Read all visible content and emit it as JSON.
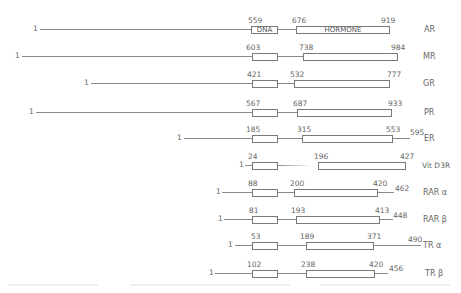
{
  "domain_labels": {
    "dna": "DNA",
    "hormone": "HORMONE"
  },
  "receptors": [
    {
      "name": "AR",
      "start": "1",
      "dna_start": "559",
      "hormone_start": "676",
      "hormone_end": "919",
      "total": null
    },
    {
      "name": "MR",
      "start": "1",
      "dna_start": "603",
      "hormone_start": "738",
      "hormone_end": "984",
      "total": null
    },
    {
      "name": "GR",
      "start": "1",
      "dna_start": "421",
      "hormone_start": "532",
      "hormone_end": "777",
      "total": null
    },
    {
      "name": "PR",
      "start": "1",
      "dna_start": "567",
      "hormone_start": "687",
      "hormone_end": "933",
      "total": null
    },
    {
      "name": "ER",
      "start": "1",
      "dna_start": "185",
      "hormone_start": "315",
      "hormone_end": "553",
      "total": "595"
    },
    {
      "name": "Vit D3R",
      "start": "1",
      "dna_start": "24",
      "hormone_start": "196",
      "hormone_end": "427",
      "total": null
    },
    {
      "name": "RAR α",
      "start": "1",
      "dna_start": "88",
      "hormone_start": "200",
      "hormone_end": "420",
      "total": "462"
    },
    {
      "name": "RAR β",
      "start": "1",
      "dna_start": "81",
      "hormone_start": "193",
      "hormone_end": "413",
      "total": "448"
    },
    {
      "name": "TR α",
      "start": "1",
      "dna_start": "53",
      "hormone_start": "189",
      "hormone_end": "371",
      "total": "490"
    },
    {
      "name": "TR β",
      "start": "1",
      "dna_start": "102",
      "hormone_start": "238",
      "hormone_end": "420",
      "total": "456"
    }
  ]
}
